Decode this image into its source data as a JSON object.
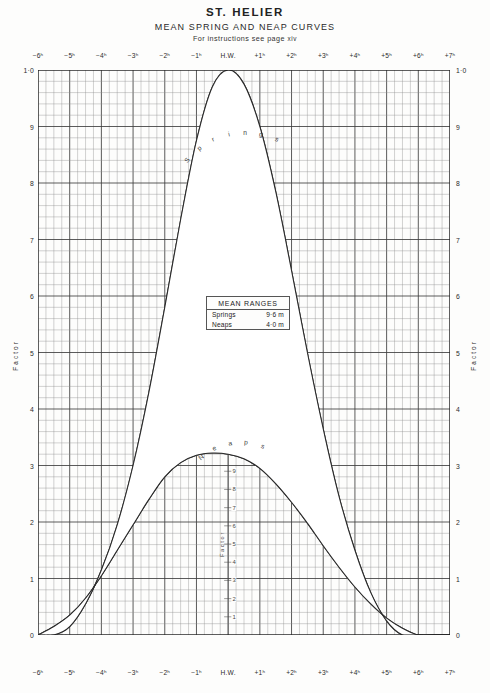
{
  "header": {
    "title": "ST. HELIER",
    "subtitle": "MEAN SPRING AND NEAP CURVES",
    "instructions_prefix": "For instructions see page",
    "instructions_page": "xiv"
  },
  "mean_ranges": {
    "title": "MEAN RANGES",
    "rows": [
      {
        "name": "Springs",
        "value": "9·6 m"
      },
      {
        "name": "Neaps",
        "value": "4·0 m"
      }
    ]
  },
  "axes": {
    "y_title_left": "Factor",
    "y_title_right": "Factor",
    "inner_y_title": "Factor",
    "x_tick_labels": [
      "−6ʰ",
      "−5ʰ",
      "−4ʰ",
      "−3ʰ",
      "−2ʰ",
      "−1ʰ",
      "H.W.",
      "+1ʰ",
      "+2ʰ",
      "+3ʰ",
      "+4ʰ",
      "+5ʰ",
      "+6ʰ",
      "+7ʰ"
    ],
    "y_tick_labels": [
      "1·0",
      "9",
      "8",
      "7",
      "6",
      "5",
      "4",
      "3",
      "2",
      "1",
      "0"
    ],
    "inner_y_tick_labels": [
      "9",
      "8",
      "7",
      "6",
      "5",
      "4",
      "3",
      "2",
      "1"
    ]
  },
  "curve_labels": {
    "springs": "Springs",
    "neaps": "Neaps"
  },
  "chart_data": {
    "type": "line",
    "xlabel": "Hours relative to High Water",
    "ylabel": "Factor",
    "xlim": [
      -6,
      7
    ],
    "ylim": [
      0,
      1.0
    ],
    "grid": true,
    "x_major_step": 1,
    "x_minor_step": 0.25,
    "y_major_step": 0.1,
    "y_minor_step": 0.02,
    "x": [
      -6,
      -5.5,
      -5,
      -4.5,
      -4,
      -3.5,
      -3,
      -2.5,
      -2,
      -1.5,
      -1,
      -0.5,
      0,
      0.5,
      1,
      1.5,
      2,
      2.5,
      3,
      3.5,
      4,
      4.5,
      5,
      5.5,
      6,
      6.5,
      7
    ],
    "series": [
      {
        "name": "Springs",
        "values": [
          0.0,
          0.0,
          0.015,
          0.055,
          0.115,
          0.195,
          0.3,
          0.43,
          0.58,
          0.735,
          0.875,
          0.97,
          1.0,
          0.975,
          0.9,
          0.785,
          0.645,
          0.5,
          0.365,
          0.245,
          0.15,
          0.075,
          0.025,
          0.0,
          0.0,
          0.0,
          0.0
        ]
      },
      {
        "name": "Neaps",
        "values": [
          0.0,
          0.015,
          0.035,
          0.065,
          0.105,
          0.15,
          0.195,
          0.24,
          0.28,
          0.305,
          0.318,
          0.322,
          0.32,
          0.312,
          0.295,
          0.268,
          0.235,
          0.198,
          0.158,
          0.12,
          0.085,
          0.055,
          0.03,
          0.012,
          0.0,
          0.0,
          0.0
        ]
      }
    ],
    "annotations": [
      {
        "text": "MEAN RANGES Springs 9·6 m",
        "x": 0,
        "y": 0.49
      },
      {
        "text": "MEAN RANGES Neaps 4·0 m",
        "x": 0,
        "y": 0.46
      }
    ]
  }
}
